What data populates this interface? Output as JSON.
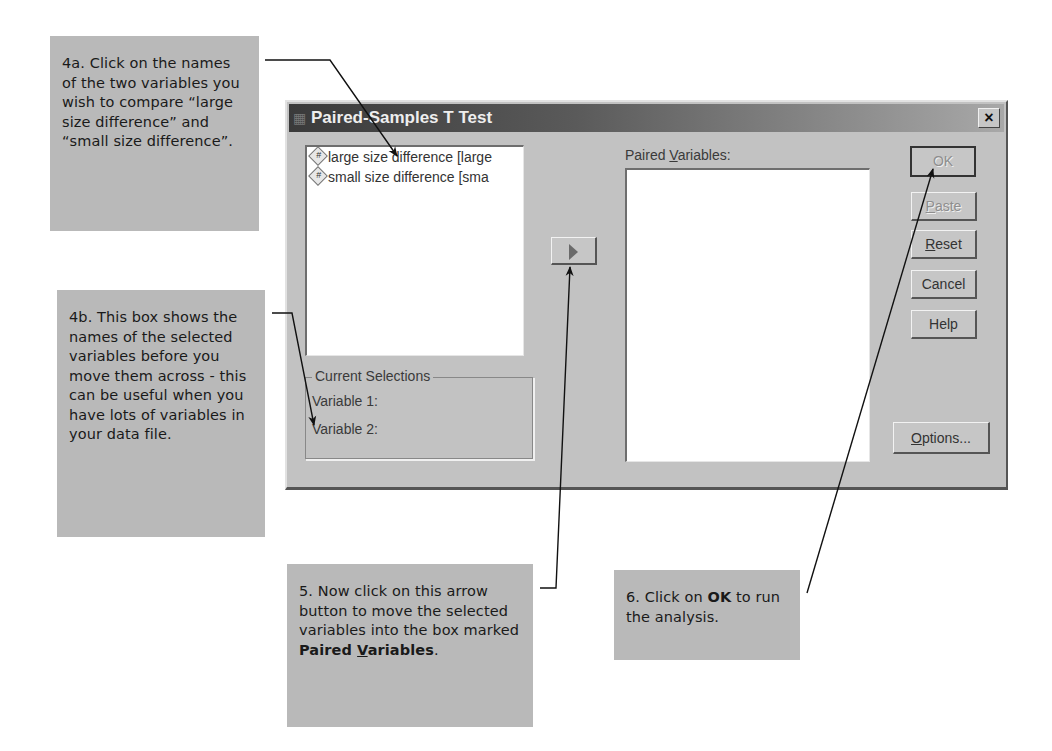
{
  "dialog": {
    "title": "Paired-Samples T Test",
    "close_label": "×",
    "source_variables": [
      {
        "label": "large size difference [large",
        "icon": "numeric-variable-icon"
      },
      {
        "label": "small size difference [sma",
        "icon": "numeric-variable-icon"
      }
    ],
    "move_button_icon": "right-arrow-icon",
    "paired_variables_label_pre": "Paired ",
    "paired_variables_label_key": "V",
    "paired_variables_label_post": "ariables:",
    "paired_variables": [],
    "current_selections": {
      "title": "Current Selections",
      "variable1_label": "Variable 1:",
      "variable2_label": "Variable 2:"
    },
    "buttons": {
      "ok": "OK",
      "paste_key": "P",
      "paste_rest": "aste",
      "reset_key": "R",
      "reset_rest": "eset",
      "cancel": "Cancel",
      "help": "Help",
      "options_key": "O",
      "options_rest": "ptions..."
    }
  },
  "callouts": {
    "c4a": "4a. Click on the names of the two variables you wish to compare “large size difference” and “small size difference”.",
    "c4b": "4b. This box shows the names of the selected variables before you move them across - this can be useful when you have lots of variables in your data file.",
    "c5_text": "5. Now click on this arrow button to move the selected variables into the box marked ",
    "c5_bold_pre": "Paired ",
    "c5_bold_key": "V",
    "c5_bold_post": "ariables",
    "c5_end": ".",
    "c6_pre": "6. Click on ",
    "c6_bold": "OK",
    "c6_post": " to run the analysis."
  },
  "colors": {
    "callout_bg": "#b9b9b9",
    "dialog_bg": "#c2c2c2",
    "titlebar_dark": "#3a3a3a"
  }
}
